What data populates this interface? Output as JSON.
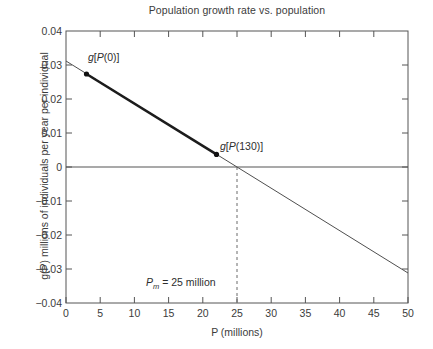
{
  "chart_data": {
    "type": "line",
    "title": "Population growth rate vs. population",
    "xlabel": "P (millions)",
    "ylabel": "g(P) millions of individuals per year per individual",
    "xlim": [
      0,
      50
    ],
    "ylim": [
      -0.04,
      0.04
    ],
    "grid": false,
    "legend": null,
    "xticks": [
      0,
      5,
      10,
      15,
      20,
      25,
      30,
      35,
      40,
      45,
      50
    ],
    "xticklabels": [
      "0",
      "5",
      "10",
      "15",
      "20",
      "25",
      "30",
      "35",
      "40",
      "45",
      "50"
    ],
    "yticks": [
      0.04,
      0.03,
      0.02,
      0.01,
      0,
      -0.01,
      -0.02,
      -0.03,
      -0.04
    ],
    "yticklabels": [
      "0.04",
      "0.03",
      "0.02",
      "0.01",
      "0",
      "−0.01",
      "−0.02",
      "−0.03",
      "−0.04"
    ],
    "series": [
      {
        "name": "g(P) thin line",
        "style": "solid-thin",
        "x": [
          0,
          50
        ],
        "values": [
          0.0312,
          -0.0312
        ]
      },
      {
        "name": "g(P) highlighted segment",
        "style": "solid-thick",
        "x": [
          3,
          22
        ],
        "values": [
          0.0274,
          0.0037
        ]
      }
    ],
    "markers": [
      {
        "label": "g[P(0)]",
        "x": 3,
        "y": 0.0274
      },
      {
        "label": "g[P(130)]",
        "x": 22,
        "y": 0.0037
      }
    ],
    "reference_lines": [
      {
        "name": "zero-horizontal",
        "orientation": "horizontal",
        "value": 0,
        "style": "solid"
      },
      {
        "name": "pm-vertical",
        "orientation": "vertical",
        "value": 25,
        "style": "dashed"
      }
    ],
    "annotations": [
      {
        "name": "pm-annotation",
        "text_prefix": "P",
        "text_sub": "m",
        "text_suffix": " = 25 million",
        "x": 25,
        "y": -0.034
      }
    ],
    "colors": {
      "line": "#4f4f4f",
      "axis": "#555555",
      "text": "#3b3b3b",
      "marker": "#1a1a1a",
      "background": "#ffffff"
    }
  },
  "markers": {
    "m0_label": "g[P(0)]",
    "m1_label": "g[P(130)]"
  },
  "pm": {
    "symbol": "P",
    "subscript": "m",
    "rest": " = 25 million"
  }
}
